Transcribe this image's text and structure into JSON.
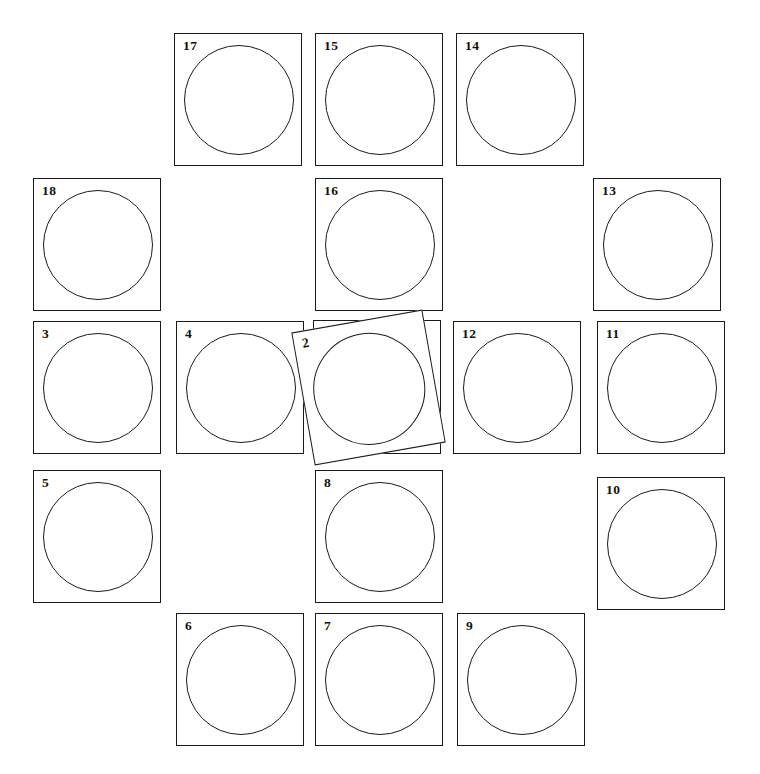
{
  "figure": {
    "title": "",
    "background_color": "#ffffff",
    "stroke_color": "#1a1a1a",
    "label_color": "#111111",
    "card_count": 18
  },
  "cards": [
    {
      "id": "card-1",
      "label": "1",
      "x": 313,
      "y": 320,
      "width": 128,
      "height": 134,
      "circle": {
        "left": 9,
        "top": 12,
        "size": 110
      },
      "rotation": 0,
      "stacking": "under"
    },
    {
      "id": "card-2",
      "label": "2",
      "x": 302,
      "y": 320,
      "width": 133,
      "height": 135,
      "circle": {
        "left": 10,
        "top": 12,
        "size": 112
      },
      "rotation": -10,
      "stacking": "rotated"
    },
    {
      "id": "card-3",
      "label": "3",
      "x": 33,
      "y": 321,
      "width": 128,
      "height": 133,
      "circle": {
        "left": 9,
        "top": 11,
        "size": 110
      },
      "rotation": 0,
      "stacking": "normal"
    },
    {
      "id": "card-4",
      "label": "4",
      "x": 176,
      "y": 321,
      "width": 128,
      "height": 133,
      "circle": {
        "left": 9,
        "top": 11,
        "size": 110
      },
      "rotation": 0,
      "stacking": "normal"
    },
    {
      "id": "card-5",
      "label": "5",
      "x": 33,
      "y": 470,
      "width": 128,
      "height": 133,
      "circle": {
        "left": 9,
        "top": 11,
        "size": 110
      },
      "rotation": 0,
      "stacking": "normal"
    },
    {
      "id": "card-6",
      "label": "6",
      "x": 176,
      "y": 613,
      "width": 128,
      "height": 133,
      "circle": {
        "left": 9,
        "top": 11,
        "size": 110
      },
      "rotation": 0,
      "stacking": "normal"
    },
    {
      "id": "card-7",
      "label": "7",
      "x": 315,
      "y": 613,
      "width": 128,
      "height": 133,
      "circle": {
        "left": 9,
        "top": 11,
        "size": 110
      },
      "rotation": 0,
      "stacking": "normal"
    },
    {
      "id": "card-8",
      "label": "8",
      "x": 315,
      "y": 470,
      "width": 128,
      "height": 133,
      "circle": {
        "left": 9,
        "top": 11,
        "size": 110
      },
      "rotation": 0,
      "stacking": "normal"
    },
    {
      "id": "card-9",
      "label": "9",
      "x": 457,
      "y": 613,
      "width": 128,
      "height": 133,
      "circle": {
        "left": 9,
        "top": 11,
        "size": 110
      },
      "rotation": 0,
      "stacking": "normal"
    },
    {
      "id": "card-10",
      "label": "10",
      "x": 597,
      "y": 477,
      "width": 128,
      "height": 133,
      "circle": {
        "left": 9,
        "top": 11,
        "size": 110
      },
      "rotation": 0,
      "stacking": "normal"
    },
    {
      "id": "card-11",
      "label": "11",
      "x": 597,
      "y": 321,
      "width": 128,
      "height": 133,
      "circle": {
        "left": 9,
        "top": 11,
        "size": 110
      },
      "rotation": 0,
      "stacking": "normal"
    },
    {
      "id": "card-12",
      "label": "12",
      "x": 453,
      "y": 321,
      "width": 128,
      "height": 133,
      "circle": {
        "left": 9,
        "top": 11,
        "size": 110
      },
      "rotation": 0,
      "stacking": "normal"
    },
    {
      "id": "card-13",
      "label": "13",
      "x": 593,
      "y": 178,
      "width": 128,
      "height": 133,
      "circle": {
        "left": 9,
        "top": 11,
        "size": 110
      },
      "rotation": 0,
      "stacking": "normal"
    },
    {
      "id": "card-14",
      "label": "14",
      "x": 456,
      "y": 33,
      "width": 128,
      "height": 133,
      "circle": {
        "left": 9,
        "top": 11,
        "size": 110
      },
      "rotation": 0,
      "stacking": "normal"
    },
    {
      "id": "card-15",
      "label": "15",
      "x": 315,
      "y": 33,
      "width": 128,
      "height": 133,
      "circle": {
        "left": 9,
        "top": 11,
        "size": 110
      },
      "rotation": 0,
      "stacking": "normal"
    },
    {
      "id": "card-16",
      "label": "16",
      "x": 315,
      "y": 178,
      "width": 128,
      "height": 133,
      "circle": {
        "left": 9,
        "top": 11,
        "size": 110
      },
      "rotation": 0,
      "stacking": "normal"
    },
    {
      "id": "card-17",
      "label": "17",
      "x": 174,
      "y": 33,
      "width": 128,
      "height": 133,
      "circle": {
        "left": 9,
        "top": 11,
        "size": 110
      },
      "rotation": 0,
      "stacking": "normal"
    },
    {
      "id": "card-18",
      "label": "18",
      "x": 33,
      "y": 178,
      "width": 128,
      "height": 133,
      "circle": {
        "left": 9,
        "top": 11,
        "size": 110
      },
      "rotation": 0,
      "stacking": "normal"
    }
  ]
}
